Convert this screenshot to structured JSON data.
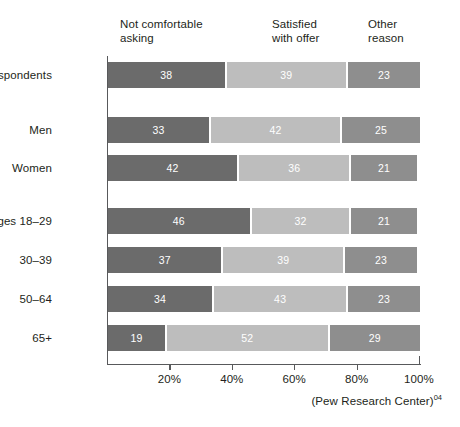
{
  "chart_data": {
    "type": "bar",
    "orientation": "horizontal",
    "stacked": true,
    "title": "",
    "subtitle": "",
    "xlabel": "",
    "ylabel": "",
    "xlim": [
      0,
      100
    ],
    "grid": false,
    "legend_position": "top",
    "categories": [
      "All respondents",
      "Men",
      "Women",
      "Ages 18-29",
      "30-39",
      "50-64",
      "65+"
    ],
    "series": [
      {
        "name": "Not comfortable asking",
        "color": "#6b6b6b",
        "values": [
          38,
          33,
          42,
          46,
          37,
          34,
          19
        ]
      },
      {
        "name": "Satisfied with offer",
        "color": "#bdbdbd",
        "values": [
          39,
          42,
          36,
          32,
          39,
          43,
          52
        ]
      },
      {
        "name": "Other reason",
        "color": "#8e8e8e",
        "values": [
          23,
          25,
          21,
          21,
          23,
          23,
          29
        ]
      }
    ],
    "xticks": [
      20,
      40,
      60,
      80,
      100
    ],
    "xticklabels": [
      "20%",
      "40%",
      "60%",
      "80%",
      "100%"
    ],
    "annotations": [
      "(Pew Research Center)"
    ]
  },
  "headers": [
    {
      "text": "Not comfortable\nasking"
    },
    {
      "text": "Satisfied\nwith offer"
    },
    {
      "text": "Other\nreason"
    }
  ],
  "rows": [
    {
      "label": "All respondents",
      "top": 62,
      "group_gap_after": true,
      "segments": [
        {
          "value": "38",
          "pct": 38
        },
        {
          "value": "39",
          "pct": 39
        },
        {
          "value": "23",
          "pct": 23
        }
      ]
    },
    {
      "label": "Men",
      "top": 117,
      "group_gap_after": false,
      "segments": [
        {
          "value": "33",
          "pct": 33
        },
        {
          "value": "42",
          "pct": 42
        },
        {
          "value": "25",
          "pct": 25
        }
      ]
    },
    {
      "label": "Women",
      "top": 155,
      "group_gap_after": true,
      "segments": [
        {
          "value": "42",
          "pct": 42
        },
        {
          "value": "36",
          "pct": 36
        },
        {
          "value": "21",
          "pct": 21
        }
      ]
    },
    {
      "label": "Ages 18–29",
      "top": 208,
      "group_gap_after": false,
      "segments": [
        {
          "value": "46",
          "pct": 46
        },
        {
          "value": "32",
          "pct": 32
        },
        {
          "value": "21",
          "pct": 21
        }
      ]
    },
    {
      "label": "30–39",
      "top": 247,
      "group_gap_after": false,
      "segments": [
        {
          "value": "37",
          "pct": 37
        },
        {
          "value": "39",
          "pct": 39
        },
        {
          "value": "23",
          "pct": 23
        }
      ]
    },
    {
      "label": "50–64",
      "top": 286,
      "group_gap_after": false,
      "segments": [
        {
          "value": "34",
          "pct": 34
        },
        {
          "value": "43",
          "pct": 43
        },
        {
          "value": "23",
          "pct": 23
        }
      ]
    },
    {
      "label": "65+",
      "top": 325,
      "group_gap_after": false,
      "segments": [
        {
          "value": "19",
          "pct": 19
        },
        {
          "value": "52",
          "pct": 52
        },
        {
          "value": "29",
          "pct": 29
        }
      ]
    }
  ],
  "axis": {
    "ticks": [
      {
        "label": "20%",
        "pct": 20
      },
      {
        "label": "40%",
        "pct": 40
      },
      {
        "label": "60%",
        "pct": 60
      },
      {
        "label": "80%",
        "pct": 80
      },
      {
        "label": "100%",
        "pct": 100
      }
    ]
  },
  "source": {
    "text": "(Pew Research Center)",
    "superscript": "04"
  },
  "colors": {
    "segment_1": "#6b6b6b",
    "segment_2": "#bdbdbd",
    "segment_3": "#8e8e8e",
    "axis": "#58595b",
    "text": "#231f20",
    "background": "#ffffff"
  }
}
